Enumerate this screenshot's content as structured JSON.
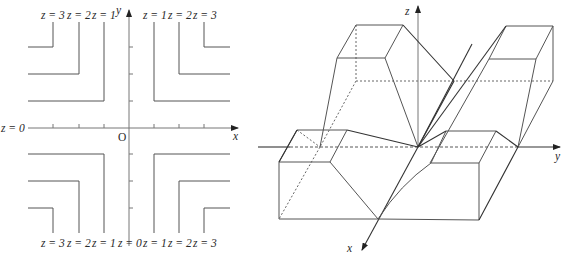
{
  "contour_plot": {
    "axes": {
      "x_label": "x",
      "y_label": "y",
      "origin_label": "O"
    },
    "left_axis_label": "z = 0",
    "top_labels": [
      "z = 3",
      "z = 2",
      "z = 1",
      "z = 1",
      "z = 2",
      "z = 3"
    ],
    "bottom_labels": [
      "z = 3",
      "z = 2",
      "z = 1",
      "z = 0",
      "z = 1",
      "z = 2",
      "z = 3"
    ],
    "contour_levels": [
      1,
      2,
      3
    ]
  },
  "surface_plot": {
    "axes": {
      "x_label": "x",
      "y_label": "y",
      "z_label": "z"
    }
  },
  "colors": {
    "line": "#555555",
    "axis": "#777777",
    "text": "#2a2a2a"
  }
}
